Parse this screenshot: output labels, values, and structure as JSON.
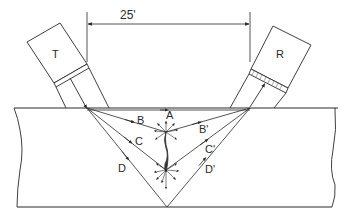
{
  "diagram": {
    "type": "ultrasonic-tofd-setup",
    "dimension": {
      "label": "25'"
    },
    "probes": [
      {
        "id": "transmitter",
        "label": "T"
      },
      {
        "id": "receiver",
        "label": "R"
      }
    ],
    "rays_in": [
      {
        "id": "A",
        "label": "A"
      },
      {
        "id": "B",
        "label": "B"
      },
      {
        "id": "C",
        "label": "C"
      },
      {
        "id": "D",
        "label": "D"
      }
    ],
    "rays_out": [
      {
        "id": "B_prime",
        "label": "B'"
      },
      {
        "id": "C_prime",
        "label": "C'"
      },
      {
        "id": "D_prime",
        "label": "D'"
      }
    ],
    "colors": {
      "line": "#2a2a2a",
      "background": "#ffffff",
      "crack": "#333333"
    }
  }
}
